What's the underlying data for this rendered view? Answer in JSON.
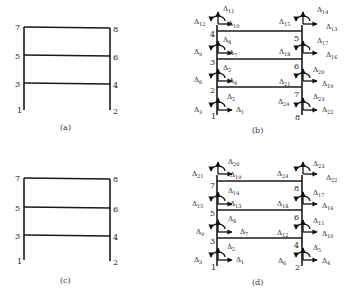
{
  "panels": [
    {
      "id": "a",
      "caption": "(a)",
      "nodes": {
        "n1": "1",
        "n2": "2",
        "n3": "3",
        "n4": "4",
        "n5": "5",
        "n6": "6",
        "n7": "7",
        "n8": "8"
      }
    },
    {
      "id": "b",
      "caption": "(b)",
      "nodes": {
        "n1": "1",
        "n2": "2",
        "n3": "3",
        "n4": "4",
        "n5": "5",
        "n6": "6",
        "n7": "7",
        "n8": "8"
      },
      "dofs": {
        "node1": [
          "1",
          "2",
          "3"
        ],
        "node2": [
          "4",
          "5",
          "6"
        ],
        "node3": [
          "7",
          "8",
          "9"
        ],
        "node4": [
          "10",
          "11",
          "12"
        ],
        "node5": [
          "13",
          "14",
          "15"
        ],
        "node6": [
          "16",
          "17",
          "18"
        ],
        "node7": [
          "19",
          "20",
          "21"
        ],
        "node8": [
          "22",
          "23",
          "24"
        ]
      }
    },
    {
      "id": "c",
      "caption": "(c)",
      "nodes": {
        "n1": "1",
        "n2": "2",
        "n3": "3",
        "n4": "4",
        "n5": "5",
        "n6": "6",
        "n7": "7",
        "n8": "8"
      }
    },
    {
      "id": "d",
      "caption": "(d)",
      "nodes": {
        "n1": "1",
        "n2": "2",
        "n3": "3",
        "n4": "4",
        "n5": "5",
        "n6": "6",
        "n7": "7",
        "n8": "8"
      },
      "dofs": {
        "node1": [
          "1",
          "2",
          "3"
        ],
        "node2": [
          "4",
          "5",
          "6"
        ],
        "node3": [
          "7",
          "8",
          "9"
        ],
        "node4": [
          "10",
          "11",
          "12"
        ],
        "node5": [
          "13",
          "14",
          "15"
        ],
        "node6": [
          "16",
          "17",
          "18"
        ],
        "node7": [
          "19",
          "20",
          "21"
        ],
        "node8": [
          "22",
          "23",
          "24"
        ]
      }
    }
  ],
  "symbol": "Δ"
}
